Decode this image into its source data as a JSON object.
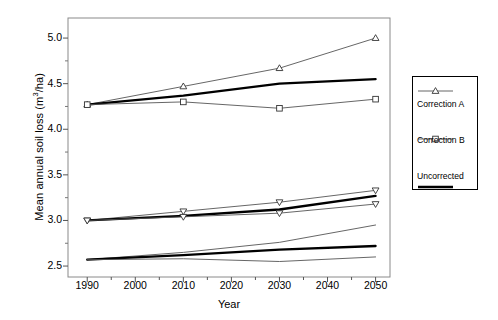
{
  "chart_data": {
    "type": "line",
    "title": "",
    "xlabel": "Year",
    "ylabel": "Mean annual soil loss (m3/ha)",
    "ylabel_prefix": "Mean annual soil loss (m",
    "ylabel_sup": "3",
    "ylabel_suffix": "/ha)",
    "x": [
      1990,
      2010,
      2030,
      2050
    ],
    "xlim": [
      1986,
      2053
    ],
    "ylim": [
      2.38,
      5.22
    ],
    "xticks": [
      "1990",
      "2000",
      "2010",
      "2020",
      "2030",
      "2040",
      "2050"
    ],
    "xtick_values": [
      1990,
      2000,
      2010,
      2020,
      2030,
      2040,
      2050
    ],
    "yticks": [
      "2.5",
      "3.0",
      "3.5",
      "4.0",
      "4.5",
      "5.0"
    ],
    "ytick_values": [
      2.5,
      3.0,
      3.5,
      4.0,
      4.5,
      5.0
    ],
    "grid": false,
    "legend_position": "right-outside",
    "series": [
      {
        "name": "Correction A",
        "group": "upper",
        "marker": "triangle-up",
        "line": "thin",
        "color": "#000000",
        "values": [
          4.27,
          4.47,
          4.67,
          5.0
        ]
      },
      {
        "name": "Uncorrected",
        "group": "upper",
        "marker": "none",
        "line": "thick",
        "color": "#000000",
        "values": [
          4.27,
          4.37,
          4.5,
          4.55
        ]
      },
      {
        "name": "Correction B",
        "group": "upper",
        "marker": "square",
        "line": "thin",
        "color": "#000000",
        "values": [
          4.27,
          4.3,
          4.23,
          4.33
        ]
      },
      {
        "name": "Correction A",
        "group": "middle",
        "marker": "triangle-down",
        "line": "thin",
        "color": "#000000",
        "values": [
          3.0,
          3.1,
          3.2,
          3.33
        ]
      },
      {
        "name": "Uncorrected",
        "group": "middle",
        "marker": "none",
        "line": "thick",
        "color": "#000000",
        "values": [
          3.0,
          3.05,
          3.12,
          3.27
        ]
      },
      {
        "name": "Correction B",
        "group": "middle",
        "marker": "triangle-down",
        "line": "thin",
        "color": "#000000",
        "values": [
          3.0,
          3.04,
          3.08,
          3.18
        ]
      },
      {
        "name": "Correction A",
        "group": "lower",
        "marker": "none",
        "line": "thin",
        "color": "#000000",
        "values": [
          2.57,
          2.65,
          2.76,
          2.95
        ]
      },
      {
        "name": "Uncorrected",
        "group": "lower",
        "marker": "none",
        "line": "thick",
        "color": "#000000",
        "values": [
          2.57,
          2.62,
          2.68,
          2.72
        ]
      },
      {
        "name": "Correction B",
        "group": "lower",
        "marker": "none",
        "line": "thin",
        "color": "#000000",
        "values": [
          2.57,
          2.58,
          2.55,
          2.6
        ]
      }
    ],
    "legend": [
      {
        "label": "Correction A",
        "marker": "triangle-up",
        "line": "thin"
      },
      {
        "label": "Correction B",
        "marker": "square",
        "line": "thin"
      },
      {
        "label": "Uncorrected",
        "marker": "none",
        "line": "thick"
      }
    ]
  }
}
